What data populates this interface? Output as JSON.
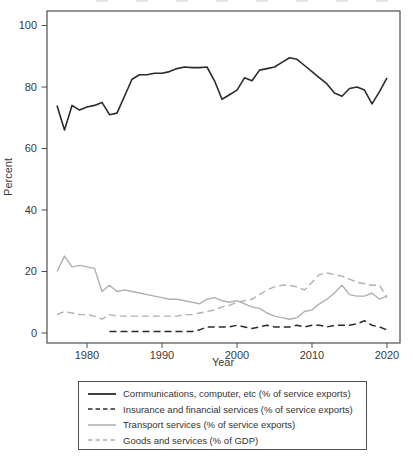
{
  "colors": {
    "axis": "#4f4f4f",
    "text": "#3a3a3a",
    "black_line": "#2b2b2b",
    "gray_line": "#b0b0b0",
    "background": "#ffffff"
  },
  "chart_data": {
    "type": "line",
    "title": "",
    "xlabel": "Year",
    "ylabel": "Percent",
    "ylim": [
      0,
      100
    ],
    "xlim": [
      1975,
      2021
    ],
    "grid": false,
    "legend_position": "bottom",
    "y_ticks": [
      0,
      20,
      40,
      60,
      80,
      100
    ],
    "x_ticks": [
      1980,
      1990,
      2000,
      2010,
      2020
    ],
    "x": [
      1976,
      1977,
      1978,
      1979,
      1980,
      1981,
      1982,
      1983,
      1984,
      1985,
      1986,
      1987,
      1988,
      1989,
      1990,
      1991,
      1992,
      1993,
      1994,
      1995,
      1996,
      1997,
      1998,
      1999,
      2000,
      2001,
      2002,
      2003,
      2004,
      2005,
      2006,
      2007,
      2008,
      2009,
      2010,
      2011,
      2012,
      2013,
      2014,
      2015,
      2016,
      2017,
      2018,
      2019,
      2020
    ],
    "series": [
      {
        "key": "communications",
        "name": "Communications, computer, etc (% of service exports)",
        "line": "solid",
        "color": "#2b2b2b",
        "values": [
          74,
          66,
          74,
          72.5,
          73.5,
          74,
          75,
          71,
          71.5,
          77,
          82.5,
          84,
          84,
          84.5,
          84.5,
          85,
          86,
          86.5,
          86.3,
          86.3,
          86.5,
          82,
          76,
          77.5,
          79,
          83,
          82,
          85.5,
          86,
          86.5,
          88,
          89.5,
          89,
          87,
          85,
          83,
          81,
          78,
          77,
          79.5,
          80,
          79,
          74.5,
          78.5,
          83
        ]
      },
      {
        "key": "insurance",
        "name": "Insurance and financial services (% of service exports)",
        "line": "dashed",
        "color": "#2b2b2b",
        "values": [
          null,
          null,
          null,
          null,
          null,
          null,
          null,
          0.5,
          0.5,
          0.5,
          0.5,
          0.5,
          0.5,
          0.5,
          0.5,
          0.5,
          0.5,
          0.5,
          0.5,
          1,
          2,
          2,
          2,
          2,
          2.5,
          2,
          1.5,
          2,
          2.5,
          2,
          2,
          2,
          2.5,
          2,
          2.5,
          2.5,
          2,
          2.5,
          2.5,
          2.5,
          3,
          4,
          2.5,
          2,
          1
        ]
      },
      {
        "key": "transport",
        "name": "Transport services (% of service exports)",
        "line": "solid",
        "color": "#b0b0b0",
        "values": [
          20,
          25,
          21.5,
          22,
          21.5,
          21,
          13.5,
          15.5,
          13.5,
          14,
          13.5,
          13,
          12.5,
          12,
          11.5,
          11,
          11,
          10.5,
          10,
          9.5,
          11,
          11.5,
          10.5,
          10,
          10.5,
          9.5,
          8.5,
          8,
          6.5,
          5.5,
          5,
          4.5,
          5,
          7,
          7.5,
          9.5,
          11,
          13,
          15.5,
          12.5,
          12,
          12,
          13,
          11,
          12
        ]
      },
      {
        "key": "goods",
        "name": "Goods and services (% of GDP)",
        "line": "dashed",
        "color": "#b0b0b0",
        "values": [
          6,
          7,
          6.5,
          6,
          6,
          5.5,
          4.5,
          6,
          5.5,
          5.5,
          5.5,
          5.5,
          5.5,
          5.5,
          5.5,
          5.5,
          5.5,
          6,
          6,
          6.5,
          7,
          7.5,
          8.5,
          9,
          10,
          10.5,
          11,
          12.5,
          14,
          15,
          15.5,
          15.5,
          15,
          14,
          16.5,
          19,
          19.5,
          19,
          18.5,
          17.5,
          16.5,
          16,
          15.5,
          15.5,
          11.5
        ]
      }
    ]
  }
}
